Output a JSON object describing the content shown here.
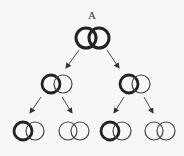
{
  "diagram": {
    "title_label": "A",
    "colors": {
      "stroke": "#222222",
      "background": "#f7f7f5"
    },
    "nodes": [
      {
        "id": "A",
        "level": 0,
        "strands": [
          "thick",
          "thick"
        ]
      },
      {
        "id": "L1-left",
        "level": 1,
        "strands": [
          "thick",
          "thin"
        ]
      },
      {
        "id": "L1-right",
        "level": 1,
        "strands": [
          "thick",
          "thin"
        ]
      },
      {
        "id": "L2-1",
        "level": 2,
        "strands": [
          "thick",
          "thin"
        ]
      },
      {
        "id": "L2-2",
        "level": 2,
        "strands": [
          "thin",
          "thin"
        ]
      },
      {
        "id": "L2-3",
        "level": 2,
        "strands": [
          "thick",
          "thin"
        ]
      },
      {
        "id": "L2-4",
        "level": 2,
        "strands": [
          "thin",
          "thin"
        ]
      }
    ],
    "edges": [
      [
        "A",
        "L1-left"
      ],
      [
        "A",
        "L1-right"
      ],
      [
        "L1-left",
        "L2-1"
      ],
      [
        "L1-left",
        "L2-2"
      ],
      [
        "L1-right",
        "L2-3"
      ],
      [
        "L1-right",
        "L2-4"
      ]
    ]
  }
}
